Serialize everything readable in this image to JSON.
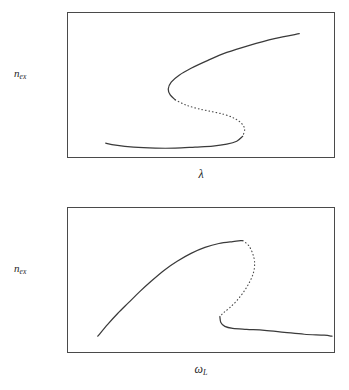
{
  "figure": {
    "background_color": "#ffffff",
    "line_color": "#3a3a3a",
    "frame_color": "#4a4a4a"
  },
  "panels": [
    {
      "id": "top",
      "ylabel_base": "n",
      "ylabel_sub": "ex",
      "xlabel_base": "λ",
      "xlabel_sub": ""
    },
    {
      "id": "bottom",
      "ylabel_base": "n",
      "ylabel_sub": "ex",
      "xlabel_base": "ω",
      "xlabel_sub": "L"
    }
  ],
  "chart_data": [
    {
      "type": "line",
      "title": "",
      "xlabel": "λ",
      "ylabel": "n_ex",
      "grid": false,
      "legend": "none",
      "axis_ticks": false,
      "xlim": [
        0,
        268
      ],
      "ylim": [
        0,
        146
      ],
      "note": "S-shaped (rotated) bistability curve: two solid stable branches joined by a dotted unstable branch.",
      "series": [
        {
          "name": "upper-stable-branch",
          "style": "solid",
          "points": [
            [
              233,
              21
            ],
            [
              208,
              26
            ],
            [
              182,
              33
            ],
            [
              160,
              40
            ],
            [
              141,
              48
            ],
            [
              124,
              56
            ],
            [
              112,
              63
            ],
            [
              104,
              70
            ],
            [
              101,
              77
            ],
            [
              103,
              83
            ],
            [
              108,
              88
            ]
          ]
        },
        {
          "name": "unstable-branch",
          "style": "dotted",
          "points": [
            [
              108,
              88
            ],
            [
              118,
              93
            ],
            [
              131,
              97
            ],
            [
              145,
              100
            ],
            [
              158,
              103
            ],
            [
              168,
              107
            ],
            [
              175,
              112
            ],
            [
              178,
              118
            ],
            [
              176,
              125
            ]
          ]
        },
        {
          "name": "lower-stable-branch",
          "style": "solid",
          "points": [
            [
              176,
              125
            ],
            [
              170,
              130
            ],
            [
              160,
              133
            ],
            [
              146,
              135
            ],
            [
              128,
              136
            ],
            [
              108,
              137
            ],
            [
              88,
              137
            ],
            [
              66,
              136
            ],
            [
              48,
              134
            ],
            [
              38,
              132
            ]
          ]
        }
      ]
    },
    {
      "type": "line",
      "title": "",
      "xlabel": "ω_L",
      "ylabel": "n_ex",
      "grid": false,
      "legend": "none",
      "axis_ticks": false,
      "xlim": [
        0,
        268
      ],
      "ylim": [
        0,
        146
      ],
      "note": "Bistability resonance curve: solid branch rises from lower-left to a peak, dotted unstable branch falls from the peak, solid lower branch runs off to the right.",
      "series": [
        {
          "name": "upper-stable-branch",
          "style": "solid",
          "points": [
            [
              30,
              130
            ],
            [
              40,
              118
            ],
            [
              50,
              107
            ],
            [
              61,
              96
            ],
            [
              72,
              85
            ],
            [
              84,
              74
            ],
            [
              97,
              63
            ],
            [
              110,
              54
            ],
            [
              124,
              46
            ],
            [
              138,
              40
            ],
            [
              152,
              36
            ],
            [
              166,
              34
            ],
            [
              176,
              33
            ]
          ]
        },
        {
          "name": "unstable-branch",
          "style": "dotted",
          "points": [
            [
              176,
              33
            ],
            [
              182,
              38
            ],
            [
              186,
              46
            ],
            [
              188,
              55
            ],
            [
              187,
              65
            ],
            [
              183,
              75
            ],
            [
              177,
              85
            ],
            [
              170,
              94
            ],
            [
              163,
              101
            ],
            [
              157,
              106
            ],
            [
              153,
              110
            ]
          ]
        },
        {
          "name": "lower-stable-branch",
          "style": "solid",
          "points": [
            [
              153,
              110
            ],
            [
              154,
              116
            ],
            [
              158,
              120
            ],
            [
              166,
              122
            ],
            [
              180,
              123
            ],
            [
              198,
              124
            ],
            [
              218,
              126
            ],
            [
              238,
              128
            ],
            [
              258,
              129
            ],
            [
              266,
              130
            ]
          ]
        }
      ]
    }
  ]
}
